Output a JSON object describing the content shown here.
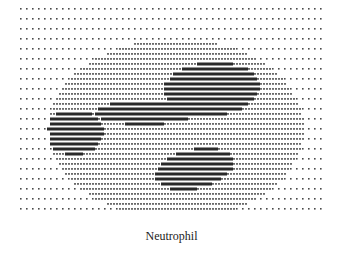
{
  "figure": {
    "subject": "neutrophil",
    "style": "dot-matrix halftone",
    "caption": "Neutrophil",
    "colors": {
      "background": "#ffffff",
      "dot": "#4a4a4a",
      "cytoplasm_dot": "#6a6a6a",
      "nucleus": "#2a2a2a"
    },
    "field": {
      "x": 20,
      "y": 8,
      "width": 305,
      "height": 202,
      "dot_pitch_x": 6,
      "dot_pitch_y": 5
    },
    "cell": {
      "cx": 175,
      "cy": 128,
      "rx": 128,
      "ry": 90
    },
    "nucleus_lobes": [
      {
        "cx": 210,
        "cy": 88,
        "rx": 48,
        "ry": 27,
        "rot": -4
      },
      {
        "cx": 143,
        "cy": 112,
        "rx": 50,
        "ry": 12,
        "rot": 0
      },
      {
        "cx": 72,
        "cy": 131,
        "rx": 30,
        "ry": 23,
        "rot": 0
      },
      {
        "cx": 193,
        "cy": 168,
        "rx": 40,
        "ry": 20,
        "rot": -12
      }
    ]
  }
}
